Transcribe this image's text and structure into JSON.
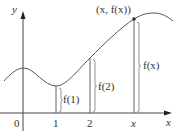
{
  "figure": {
    "axes": {
      "y_label": "y",
      "x_label": "x",
      "origin_label": "0",
      "tick_labels": [
        "1",
        "2",
        "x"
      ]
    },
    "point_label": "(x, f(x))",
    "height_labels": {
      "f1": "f(1)",
      "f2": "f(2)",
      "fx": "f(x)"
    },
    "colors": {
      "curve": "#555555",
      "axes": "#444444",
      "text": "#333333",
      "background": "#ffffff"
    }
  }
}
